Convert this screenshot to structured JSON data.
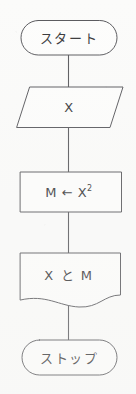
{
  "diagram": {
    "orientation": "vertical",
    "background_color": "#fbfbfa",
    "stroke_color": "#5a5a5e",
    "text_color": "#3a3a3c",
    "nodes": [
      {
        "id": "start",
        "shape": "terminator",
        "label": "スタート",
        "name": "start-terminator"
      },
      {
        "id": "input-x",
        "shape": "parallelogram",
        "label": "X",
        "name": "input-parallelogram"
      },
      {
        "id": "process-m",
        "shape": "rectangle",
        "label_prefix": "M ← X",
        "label_superscript": "2",
        "label": "M ← X2",
        "name": "process-rectangle"
      },
      {
        "id": "output-xm",
        "shape": "document",
        "label": "X と M",
        "name": "document-output"
      },
      {
        "id": "stop",
        "shape": "terminator",
        "label": "ストップ",
        "name": "stop-terminator"
      }
    ],
    "connectors": [
      {
        "id": "c1",
        "from": "start",
        "to": "input-x"
      },
      {
        "id": "c2",
        "from": "input-x",
        "to": "process-m"
      },
      {
        "id": "c3",
        "from": "process-m",
        "to": "output-xm"
      },
      {
        "id": "c4",
        "from": "output-xm",
        "to": "stop"
      }
    ]
  }
}
